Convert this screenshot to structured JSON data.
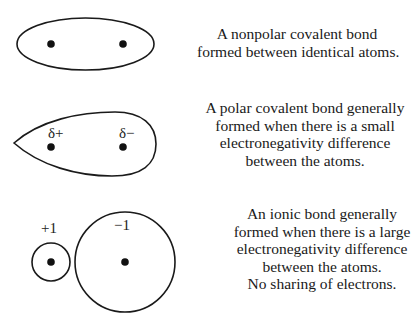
{
  "panels": [
    {
      "id": "nonpolar",
      "shape": "ellipse",
      "atom_labels": [],
      "description": [
        "A nonpolar covalent bond",
        "formed between identical atoms."
      ]
    },
    {
      "id": "polar",
      "shape": "teardrop",
      "atom_labels": [
        "δ+",
        "δ−"
      ],
      "description": [
        "A polar covalent bond generally",
        "formed when there is a small",
        "electronegativity difference",
        "between the atoms."
      ]
    },
    {
      "id": "ionic",
      "shape": "two-circles",
      "atom_labels": [
        "+1",
        "−1"
      ],
      "description": [
        "An ionic bond generally",
        "formed when there is a large",
        "electronegativity difference",
        "between the atoms.",
        "No sharing of electrons."
      ]
    }
  ],
  "colors": {
    "stroke": "#1a1a1a",
    "background": "#ffffff"
  }
}
